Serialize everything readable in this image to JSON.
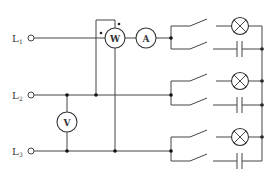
{
  "diagram": {
    "type": "three-phase circuit schematic",
    "lines": [
      {
        "id": "L1",
        "label": "L",
        "subscript": "1"
      },
      {
        "id": "L2",
        "label": "L",
        "subscript": "2"
      },
      {
        "id": "L3",
        "label": "L",
        "subscript": "3"
      }
    ],
    "meters": {
      "wattmeter": "W",
      "ammeter": "A",
      "voltmeter": "V"
    },
    "loads": [
      {
        "phase": "L1",
        "components": [
          "switch",
          "lamp",
          "switch",
          "capacitor"
        ]
      },
      {
        "phase": "L2",
        "components": [
          "switch",
          "lamp",
          "switch",
          "capacitor"
        ]
      },
      {
        "phase": "L3",
        "components": [
          "switch",
          "lamp",
          "switch",
          "capacitor"
        ]
      }
    ],
    "wattmeter_polarity_mark": "•"
  }
}
